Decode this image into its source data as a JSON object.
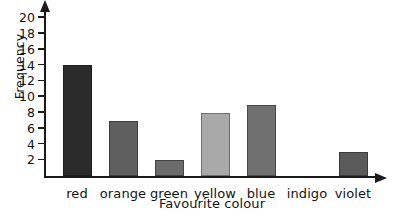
{
  "chart_data": {
    "type": "bar",
    "title": "",
    "xlabel": "Favourite colour",
    "ylabel": "Frequency",
    "categories": [
      "red",
      "orange",
      "green",
      "yellow",
      "blue",
      "indigo",
      "violet"
    ],
    "values": [
      14,
      7,
      2,
      8,
      9,
      0,
      3
    ],
    "ylim": [
      0,
      21
    ],
    "ytick_labels": [
      "2",
      "4",
      "6",
      "8",
      "10",
      "12",
      "14",
      "16",
      "18",
      "20"
    ],
    "ytick_values": [
      2,
      4,
      6,
      8,
      10,
      12,
      14,
      16,
      18,
      20
    ],
    "grid": false,
    "legend": null,
    "bar_colors": [
      "#2b2b2b",
      "#5f5f5f",
      "#6b6b6b",
      "#a9a9a9",
      "#707070",
      "#707070",
      "#5a5a5a"
    ],
    "axis_color": "#1a1a1a",
    "background": "#ffffff"
  }
}
